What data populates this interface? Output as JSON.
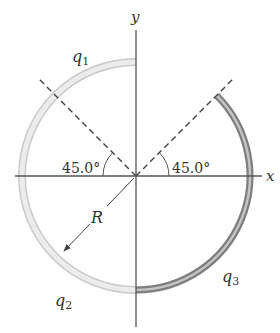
{
  "figure": {
    "axes": {
      "x_label": "x",
      "y_label": "y"
    },
    "angles": {
      "left": "45.0°",
      "right": "45.0°"
    },
    "radius_label": "R",
    "charges": {
      "q1": {
        "base": "q",
        "sub": "1"
      },
      "q2": {
        "base": "q",
        "sub": "2"
      },
      "q3": {
        "base": "q",
        "sub": "3"
      }
    },
    "colors": {
      "axis": "#555555",
      "light_arc": "#dcdcdc",
      "light_arc_edge": "#c4c4c4",
      "dark_arc": "#8a8a8a",
      "dark_arc_highlight": "#c8c8c8",
      "dashed": "#444444"
    }
  }
}
